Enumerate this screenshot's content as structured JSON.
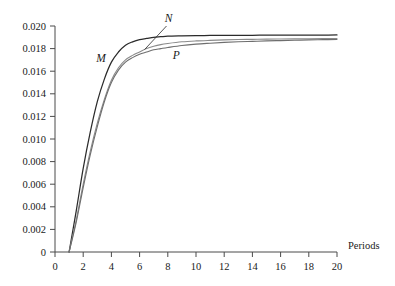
{
  "chart_data": {
    "type": "line",
    "title": "",
    "xlabel": "Periods",
    "ylabel": "",
    "xlim": [
      0,
      20
    ],
    "ylim": [
      0,
      0.02
    ],
    "grid": false,
    "legend_position": "inline-annotations",
    "xticks": [
      "0",
      "2",
      "4",
      "6",
      "8",
      "10",
      "12",
      "14",
      "16",
      "18",
      "20"
    ],
    "xtick_values": [
      0,
      2,
      4,
      6,
      8,
      10,
      12,
      14,
      16,
      18,
      20
    ],
    "yticks": [
      "0",
      "0.002",
      "0.004",
      "0.006",
      "0.008",
      "0.010",
      "0.012",
      "0.014",
      "0.016",
      "0.018",
      "0.020"
    ],
    "ytick_values": [
      0,
      0.002,
      0.004,
      0.006,
      0.008,
      0.01,
      0.012,
      0.014,
      0.016,
      0.018,
      0.02
    ],
    "x": [
      1,
      1.5,
      2,
      2.5,
      3,
      3.5,
      4,
      4.5,
      5,
      5.5,
      6,
      6.5,
      7,
      7.5,
      8,
      9,
      10,
      11,
      12,
      13,
      14,
      15,
      16,
      17,
      18,
      19,
      20
    ],
    "series": [
      {
        "name": "M",
        "label": "M",
        "color": "#2b2b2b",
        "values": [
          0.0,
          0.0036,
          0.0074,
          0.0106,
          0.0133,
          0.0153,
          0.0168,
          0.0177,
          0.0183,
          0.0186,
          0.0188,
          0.0189,
          0.019,
          0.01905,
          0.0191,
          0.01913,
          0.01915,
          0.01916,
          0.01917,
          0.01918,
          0.01918,
          0.01919,
          0.01919,
          0.0192,
          0.0192,
          0.0192,
          0.01921
        ]
      },
      {
        "name": "N",
        "label": "N",
        "color": "#8a8a8a",
        "values": [
          0.0,
          0.0028,
          0.006,
          0.0089,
          0.0114,
          0.0135,
          0.0152,
          0.0163,
          0.017,
          0.0174,
          0.0177,
          0.018,
          0.0182,
          0.01835,
          0.01845,
          0.0186,
          0.01868,
          0.01873,
          0.01877,
          0.0188,
          0.01882,
          0.01884,
          0.01885,
          0.01886,
          0.01887,
          0.01888,
          0.01889
        ]
      },
      {
        "name": "P",
        "label": "P",
        "color": "#6e6e6e",
        "values": [
          0.0,
          0.0026,
          0.0057,
          0.0086,
          0.0111,
          0.0133,
          0.015,
          0.0161,
          0.0168,
          0.0172,
          0.0175,
          0.0177,
          0.0179,
          0.018,
          0.0181,
          0.01828,
          0.0184,
          0.01848,
          0.01855,
          0.0186,
          0.01864,
          0.01868,
          0.01871,
          0.01874,
          0.01877,
          0.01879,
          0.01881
        ]
      }
    ],
    "annotations": [
      {
        "text": "M",
        "series": "M",
        "at_x": 4.2,
        "note": "label to left of M curve"
      },
      {
        "text": "N",
        "series": "N",
        "at_x": 7.4,
        "note": "label above with leader line to N curve"
      },
      {
        "text": "P",
        "series": "P",
        "at_x": 8.0,
        "note": "label below P curve"
      }
    ]
  }
}
